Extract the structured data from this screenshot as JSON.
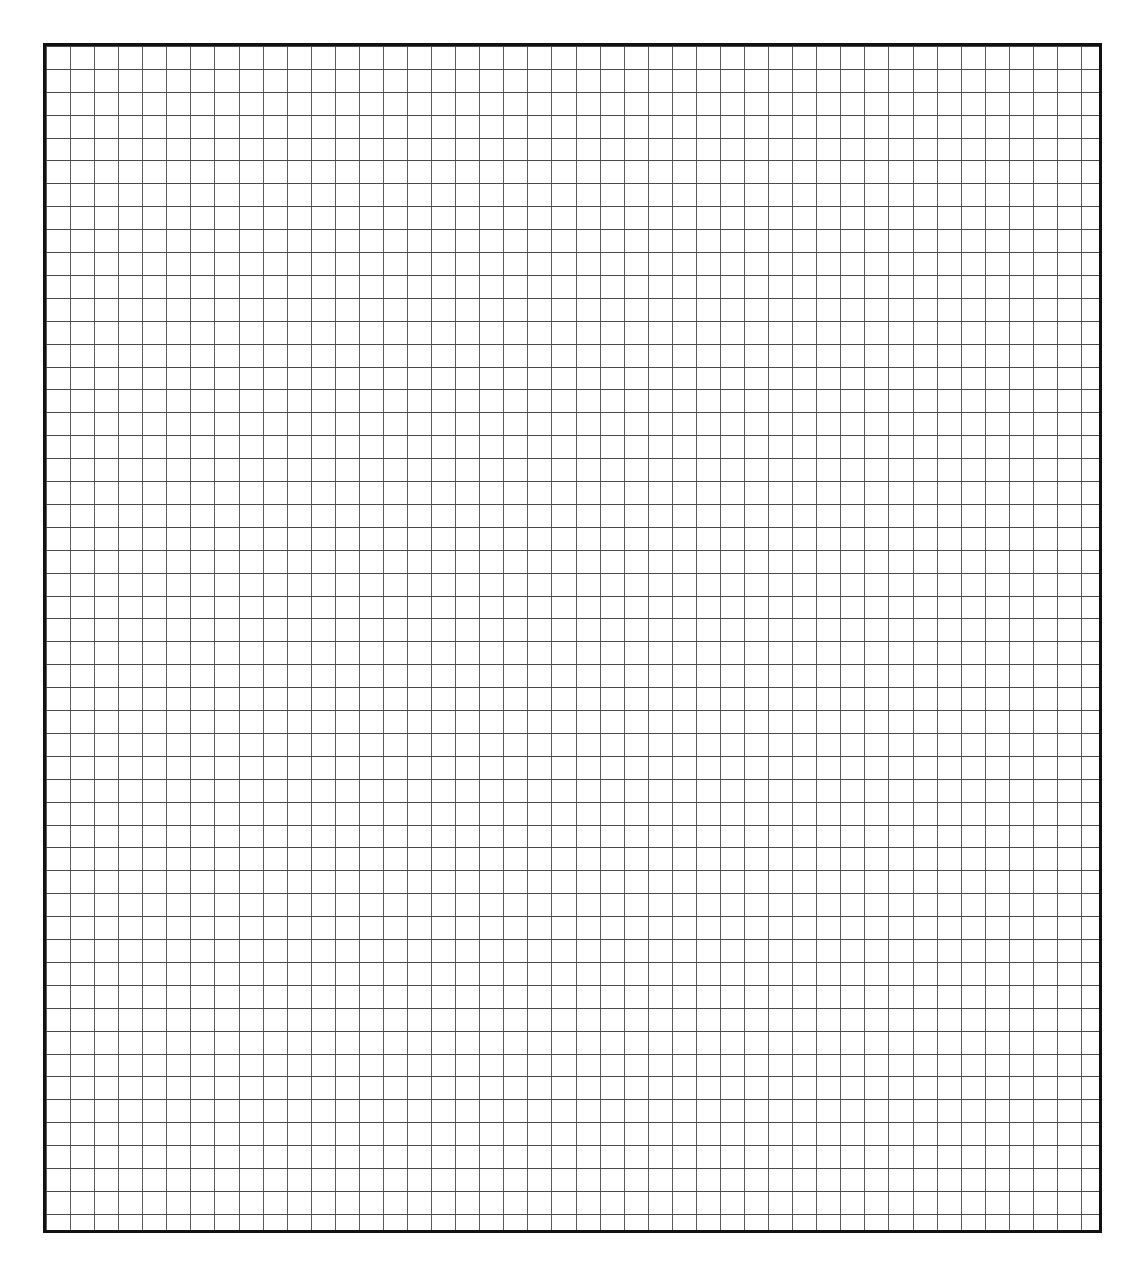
{
  "document": {
    "type": "grid-paper",
    "title": "Blank Grid Paper Sheet",
    "description": "Plain square-ruled graph paper with a heavy outer frame and no printed text, labels or markings.",
    "canvas": {
      "width_px": 1144,
      "height_px": 1283,
      "background_color": "#ffffff"
    }
  },
  "grid": {
    "label": "grid-block",
    "origin_x_px": 43,
    "origin_y_px": 43,
    "width_px": 1059,
    "height_px": 1190,
    "columns": 44,
    "rows": 52,
    "cell_width_px": 24.07,
    "cell_height_px": 22.9,
    "line_color": "#5b5b5b",
    "line_width_px": 1,
    "border_color": "#111111",
    "border_width_px": 3,
    "fill_color": "#ffffff"
  },
  "margins": {
    "top_px": 43,
    "bottom_px": 50,
    "left_px": 43,
    "right_px": 42,
    "content": ""
  },
  "annotations": {
    "text_present": "none",
    "marks_present": "none"
  },
  "chart_data": {
    "type": "table",
    "title": "",
    "subtitle": "",
    "xlabel": "",
    "ylabel": "",
    "categories": [],
    "values": [],
    "tick_labels_x": [],
    "tick_labels_y": [],
    "legend": [],
    "annotations": [],
    "grid": "on",
    "legend_position": "none",
    "columns": 44,
    "rows": 52,
    "note": "Empty square-ruled grid; no data series plotted."
  }
}
